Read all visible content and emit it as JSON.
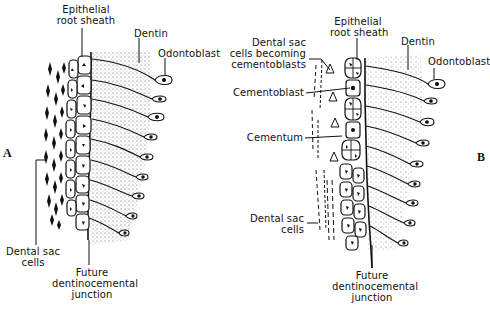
{
  "figure": {
    "panels": [
      {
        "id": "A",
        "panel_label": "A",
        "labels": {
          "epithelial_root_sheath": [
            "Epithelial",
            "root sheath"
          ],
          "dentin": "Dentin",
          "odontoblast": "Odontoblast",
          "dental_sac_cells": [
            "Dental sac",
            "cells"
          ],
          "future_junction": [
            "Future",
            "dentinocemental",
            "junction"
          ]
        }
      },
      {
        "id": "B",
        "panel_label": "B",
        "labels": {
          "epithelial_root_sheath": [
            "Epithelial",
            "root sheath"
          ],
          "dentin": "Dentin",
          "odontoblast": "Odontoblast",
          "dental_sac_becoming": [
            "Dental sac",
            "cells becoming",
            "cementoblasts"
          ],
          "cementoblast": "Cementoblast",
          "cementum": "Cementum",
          "dental_sac_cells": [
            "Dental sac",
            "cells"
          ],
          "future_junction": [
            "Future",
            "dentinocemental",
            "junction"
          ]
        }
      }
    ],
    "colors": {
      "ink": "#111111",
      "background": "#ffffff",
      "stipple": "#555555"
    }
  }
}
